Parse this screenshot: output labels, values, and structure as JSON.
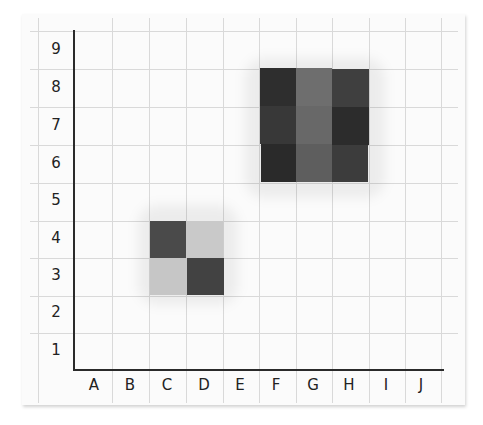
{
  "grid": {
    "x_labels": [
      "A",
      "B",
      "C",
      "D",
      "E",
      "F",
      "G",
      "H",
      "I",
      "J"
    ],
    "y_labels": [
      "9",
      "8",
      "7",
      "6",
      "5",
      "4",
      "3",
      "2",
      "1"
    ]
  },
  "blocks": {
    "large_group": [
      {
        "col": "F",
        "row": "8",
        "color": "#2e2e2e"
      },
      {
        "col": "G",
        "row": "8",
        "color": "#6e6e6e"
      },
      {
        "col": "H",
        "row": "8",
        "color": "#3f3f3f"
      },
      {
        "col": "F",
        "row": "7",
        "color": "#383838"
      },
      {
        "col": "G",
        "row": "7",
        "color": "#686868"
      },
      {
        "col": "H",
        "row": "7",
        "color": "#2c2c2c"
      },
      {
        "col": "F",
        "row": "6",
        "color": "#2a2a2a"
      },
      {
        "col": "G",
        "row": "6",
        "color": "#5e5e5e"
      },
      {
        "col": "H",
        "row": "6",
        "color": "#3c3c3c"
      }
    ],
    "small_group": [
      {
        "col": "C",
        "row": "4",
        "color": "#4a4a4a"
      },
      {
        "col": "D",
        "row": "4",
        "color": "#c9c9c9"
      },
      {
        "col": "C",
        "row": "3",
        "color": "#c6c6c6"
      },
      {
        "col": "D",
        "row": "3",
        "color": "#424242"
      }
    ]
  }
}
